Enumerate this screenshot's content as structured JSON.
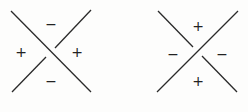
{
  "diagrams": [
    {
      "name": "positive-crossing",
      "over_strand": "top-left to bottom-right",
      "under_strand": "bottom-left to top-right",
      "labels": {
        "top": "−",
        "left": "+",
        "right": "+",
        "bottom": "−"
      }
    },
    {
      "name": "negative-crossing",
      "over_strand": "bottom-left to top-right",
      "under_strand": "top-left to bottom-right",
      "labels": {
        "top": "+",
        "left": "−",
        "right": "−",
        "bottom": "+"
      }
    }
  ],
  "colors": {
    "stroke": "#2a2a2a",
    "background": "#fdfdfc"
  }
}
